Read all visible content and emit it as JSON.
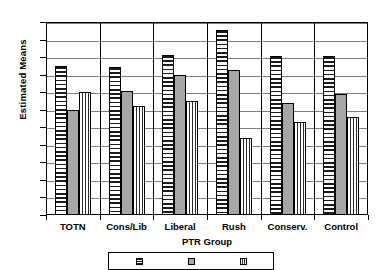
{
  "chart_data": {
    "type": "bar",
    "title": "",
    "xlabel": "PTR Group",
    "ylabel": "Estimated Means",
    "categories": [
      "TOTN",
      "Cons/Lib",
      "Liberal",
      "Rush",
      "Conserv.",
      "Control"
    ],
    "ylim": [
      0,
      27.5
    ],
    "yticks": [
      "0",
      "2.5",
      "5",
      "7.5",
      "10",
      "12.5",
      "15",
      "17.5",
      "20",
      "22.5",
      "25",
      "27.5"
    ],
    "ytick_values": [
      0,
      2.5,
      5,
      7.5,
      10,
      12.5,
      15,
      17.5,
      20,
      22.5,
      25,
      27.5
    ],
    "grid": true,
    "legend_position": "bottom",
    "legend_note": "legend box is cut off by the bottom edge of the screenshot; entry text is not legible",
    "series": [
      {
        "name": "series-1",
        "fill": "horizontal-stripes",
        "values": [
          21.2,
          21.1,
          22.8,
          26.3,
          22.6,
          22.6
        ]
      },
      {
        "name": "series-2",
        "fill": "solid-gray",
        "color": "#a6a6a6",
        "values": [
          15.0,
          17.6,
          20.0,
          20.7,
          16.0,
          17.3
        ]
      },
      {
        "name": "series-3",
        "fill": "vertical-stripes",
        "values": [
          17.5,
          15.5,
          16.3,
          11.0,
          13.3,
          14.0
        ]
      }
    ]
  }
}
